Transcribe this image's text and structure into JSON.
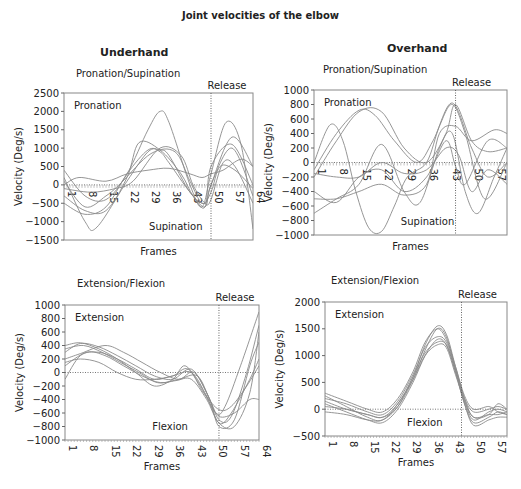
{
  "title": "Joint velocities of the elbow",
  "columns": [
    "Underhand",
    "Overhand"
  ],
  "chart_data": [
    {
      "id": "underhand-pronation",
      "type": "line",
      "title": "Pronation/Supination",
      "column": "Underhand",
      "xlabel": "Frames",
      "ylabel": "Velocity (Deg/s)",
      "ylim": [
        -1500,
        2500
      ],
      "yticks": [
        2500,
        2000,
        1500,
        1000,
        500,
        0,
        -500,
        -1000,
        -1500
      ],
      "xlim": [
        1,
        64
      ],
      "xticks": [
        1,
        8,
        15,
        22,
        29,
        36,
        43,
        50,
        57,
        64
      ],
      "xtick_position": "zero-line",
      "top_label": "Pronation",
      "bottom_label": "Supination",
      "release_frame": 50,
      "release_label": "Release",
      "box": {
        "x": 64,
        "y": 93,
        "w": 189,
        "h": 147
      },
      "series": [
        {
          "x": [
            1,
            8,
            15,
            22,
            29,
            33,
            36,
            43,
            47,
            50,
            55,
            60,
            64
          ],
          "y": [
            400,
            -300,
            -400,
            300,
            1500,
            2000,
            1700,
            0,
            -600,
            300,
            1700,
            1100,
            -1200
          ]
        },
        {
          "x": [
            1,
            8,
            12,
            22,
            29,
            33,
            36,
            43,
            48,
            50,
            57,
            64
          ],
          "y": [
            200,
            -1000,
            -1150,
            100,
            900,
            950,
            800,
            -200,
            -500,
            0,
            1300,
            500
          ]
        },
        {
          "x": [
            1,
            8,
            15,
            22,
            29,
            33,
            36,
            43,
            48,
            50,
            57,
            64
          ],
          "y": [
            -500,
            -800,
            -600,
            300,
            950,
            900,
            600,
            -200,
            -600,
            0,
            1000,
            -300
          ]
        },
        {
          "x": [
            1,
            8,
            15,
            22,
            26,
            33,
            40,
            44,
            48,
            50,
            57,
            64
          ],
          "y": [
            -300,
            -700,
            -700,
            200,
            1150,
            950,
            300,
            -300,
            -600,
            500,
            1100,
            0
          ]
        },
        {
          "x": [
            1,
            6,
            15,
            22,
            29,
            36,
            43,
            47,
            50,
            54,
            60,
            64
          ],
          "y": [
            0,
            200,
            100,
            300,
            400,
            450,
            300,
            200,
            300,
            400,
            700,
            500
          ]
        },
        {
          "x": [
            1,
            10,
            18,
            24,
            33,
            40,
            44,
            48,
            50,
            54,
            58,
            64
          ],
          "y": [
            -100,
            -200,
            -100,
            100,
            1000,
            800,
            0,
            -500,
            -400,
            600,
            500,
            -500
          ]
        },
        {
          "x": [
            1,
            8,
            15,
            20,
            30,
            38,
            43,
            47,
            50,
            53,
            58,
            64
          ],
          "y": [
            100,
            -600,
            -300,
            50,
            850,
            900,
            100,
            -500,
            -200,
            500,
            400,
            -100
          ]
        }
      ]
    },
    {
      "id": "overhand-pronation",
      "type": "line",
      "title": "Pronation/Supination",
      "column": "Overhand",
      "xlabel": "Frames",
      "ylabel": "Velocity (Deg/s)",
      "ylim": [
        -1000,
        1000
      ],
      "yticks": [
        1000,
        800,
        600,
        400,
        200,
        0,
        -200,
        -400,
        -600,
        -800,
        -1000
      ],
      "xlim": [
        1,
        61
      ],
      "xticks": [
        1,
        8,
        15,
        22,
        29,
        36,
        43,
        50,
        57
      ],
      "xtick_position": "zero-line",
      "top_label": "Pronation",
      "bottom_label": "Supination",
      "release_frame": 45,
      "release_label": "Release",
      "box": {
        "x": 314,
        "y": 90,
        "w": 193,
        "h": 145
      },
      "series": [
        {
          "x": [
            1,
            6,
            10,
            14,
            18,
            22,
            26,
            30,
            36,
            40,
            44,
            48,
            54,
            61
          ],
          "y": [
            0,
            520,
            300,
            -400,
            -900,
            -950,
            -600,
            -200,
            0,
            500,
            800,
            400,
            -500,
            0
          ]
        },
        {
          "x": [
            1,
            8,
            15,
            20,
            26,
            33,
            38,
            44,
            50,
            55,
            61
          ],
          "y": [
            -100,
            400,
            720,
            650,
            300,
            0,
            300,
            820,
            200,
            -200,
            0
          ]
        },
        {
          "x": [
            1,
            8,
            15,
            22,
            29,
            36,
            42,
            45,
            50,
            55,
            61
          ],
          "y": [
            -200,
            300,
            700,
            700,
            200,
            0,
            400,
            800,
            300,
            150,
            200
          ]
        },
        {
          "x": [
            1,
            8,
            15,
            22,
            29,
            34,
            40,
            44,
            48,
            52,
            57,
            61
          ],
          "y": [
            -700,
            -500,
            -300,
            250,
            -400,
            -550,
            200,
            400,
            -400,
            -700,
            -200,
            200
          ]
        },
        {
          "x": [
            1,
            8,
            15,
            22,
            29,
            36,
            40,
            45,
            50,
            57,
            61
          ],
          "y": [
            -500,
            -500,
            -400,
            -300,
            -450,
            -300,
            400,
            500,
            300,
            450,
            400
          ]
        },
        {
          "x": [
            1,
            8,
            15,
            22,
            29,
            36,
            42,
            45,
            48,
            55,
            61
          ],
          "y": [
            -400,
            -550,
            -200,
            -100,
            -400,
            -200,
            300,
            -50,
            -300,
            300,
            200
          ]
        },
        {
          "x": [
            1,
            8,
            15,
            22,
            29,
            36,
            42,
            46,
            50,
            55,
            61
          ],
          "y": [
            -150,
            -200,
            -200,
            0,
            -150,
            -100,
            200,
            100,
            -400,
            -100,
            -300
          ]
        }
      ]
    },
    {
      "id": "underhand-extension",
      "type": "line",
      "title": "Extension/Flexion",
      "column": "Underhand",
      "xlabel": "Frames",
      "ylabel": "Velocity (Deg/s)",
      "ylim": [
        -1000,
        1000
      ],
      "yticks": [
        1000,
        800,
        600,
        400,
        200,
        0,
        -200,
        -400,
        -600,
        -800,
        -1000
      ],
      "xlim": [
        1,
        64
      ],
      "xticks": [
        1,
        8,
        15,
        22,
        29,
        36,
        43,
        50,
        57,
        64
      ],
      "xtick_position": "bottom",
      "top_label": "Extension",
      "bottom_label": "Flexion",
      "release_frame": 51,
      "release_label": "Release",
      "box": {
        "x": 65,
        "y": 305,
        "w": 194,
        "h": 135
      },
      "series": [
        {
          "x": [
            1,
            6,
            12,
            18,
            24,
            30,
            36,
            40,
            45,
            50,
            53,
            58,
            64
          ],
          "y": [
            400,
            440,
            350,
            200,
            0,
            -200,
            -100,
            100,
            -200,
            -600,
            -500,
            100,
            900
          ]
        },
        {
          "x": [
            1,
            6,
            12,
            18,
            24,
            30,
            36,
            42,
            47,
            51,
            55,
            60,
            64
          ],
          "y": [
            300,
            430,
            380,
            250,
            100,
            -50,
            -100,
            50,
            -300,
            -700,
            -650,
            0,
            700
          ]
        },
        {
          "x": [
            1,
            6,
            14,
            20,
            26,
            32,
            38,
            43,
            48,
            51,
            56,
            61,
            64
          ],
          "y": [
            200,
            280,
            400,
            300,
            150,
            0,
            -100,
            0,
            -400,
            -800,
            -700,
            100,
            450
          ]
        },
        {
          "x": [
            1,
            6,
            12,
            18,
            24,
            30,
            36,
            42,
            47,
            51,
            55,
            61,
            64
          ],
          "y": [
            -100,
            250,
            300,
            200,
            50,
            -100,
            -50,
            0,
            -350,
            -750,
            -600,
            -100,
            200
          ]
        },
        {
          "x": [
            1,
            8,
            14,
            20,
            26,
            32,
            38,
            44,
            48,
            51,
            56,
            61,
            64
          ],
          "y": [
            100,
            300,
            250,
            100,
            -50,
            -150,
            -100,
            -50,
            -400,
            -650,
            -600,
            -400,
            -400
          ]
        },
        {
          "x": [
            1,
            6,
            12,
            18,
            24,
            30,
            36,
            41,
            46,
            51,
            55,
            60,
            64
          ],
          "y": [
            150,
            200,
            150,
            0,
            -100,
            -100,
            -50,
            50,
            -300,
            -550,
            -500,
            -200,
            100
          ]
        },
        {
          "x": [
            1,
            7,
            13,
            19,
            25,
            31,
            37,
            42,
            47,
            51,
            56,
            61,
            64
          ],
          "y": [
            350,
            400,
            300,
            150,
            0,
            -150,
            -120,
            -100,
            -400,
            -750,
            -800,
            -300,
            600
          ]
        }
      ]
    },
    {
      "id": "overhand-extension",
      "type": "line",
      "title": "Extension/Flexion",
      "column": "Overhand",
      "xlabel": "Frames",
      "ylabel": "Velocity (Deg/s)",
      "ylim": [
        -500,
        2000
      ],
      "yticks": [
        2000,
        1500,
        1000,
        500,
        0,
        -500
      ],
      "xlim": [
        1,
        61
      ],
      "xticks": [
        1,
        8,
        15,
        22,
        29,
        36,
        43,
        50,
        57
      ],
      "xtick_position": "bottom",
      "top_label": "Extension",
      "bottom_label": "Flexion",
      "release_frame": 46,
      "release_label": "Release",
      "box": {
        "x": 325,
        "y": 302,
        "w": 182,
        "h": 134
      },
      "series": [
        {
          "x": [
            1,
            8,
            15,
            20,
            25,
            30,
            34,
            38,
            41,
            44,
            47,
            50,
            55,
            58,
            61
          ],
          "y": [
            250,
            50,
            -150,
            -200,
            100,
            600,
            1200,
            1550,
            1400,
            800,
            200,
            -150,
            -100,
            100,
            0
          ]
        },
        {
          "x": [
            1,
            8,
            15,
            20,
            25,
            30,
            34,
            38,
            41,
            44,
            47,
            50,
            55,
            58,
            61
          ],
          "y": [
            150,
            0,
            -100,
            -150,
            50,
            550,
            1100,
            1500,
            1350,
            750,
            150,
            -200,
            -50,
            0,
            -50
          ]
        },
        {
          "x": [
            1,
            8,
            15,
            20,
            25,
            30,
            34,
            38,
            41,
            44,
            47,
            50,
            55,
            58,
            61
          ],
          "y": [
            100,
            -50,
            -200,
            -250,
            0,
            500,
            1000,
            1300,
            1200,
            700,
            100,
            -250,
            -150,
            -50,
            -100
          ]
        },
        {
          "x": [
            1,
            8,
            15,
            20,
            25,
            30,
            34,
            38,
            41,
            44,
            47,
            50,
            55,
            58,
            61
          ],
          "y": [
            200,
            100,
            -50,
            -100,
            150,
            650,
            1150,
            1350,
            1250,
            750,
            200,
            -50,
            0,
            50,
            0
          ]
        },
        {
          "x": [
            1,
            8,
            15,
            20,
            25,
            30,
            34,
            38,
            41,
            44,
            47,
            50,
            55,
            58,
            61
          ],
          "y": [
            -50,
            -100,
            -200,
            -200,
            50,
            600,
            1050,
            1250,
            1200,
            700,
            100,
            -300,
            -200,
            -150,
            -150
          ]
        },
        {
          "x": [
            1,
            8,
            15,
            20,
            25,
            30,
            34,
            38,
            41,
            44,
            47,
            50,
            55,
            58,
            61
          ],
          "y": [
            50,
            0,
            -100,
            -150,
            100,
            550,
            1000,
            1200,
            1150,
            650,
            150,
            -150,
            -100,
            -100,
            -50
          ]
        },
        {
          "x": [
            1,
            8,
            15,
            20,
            25,
            30,
            34,
            38,
            41,
            44,
            47,
            50,
            55,
            58,
            61
          ],
          "y": [
            300,
            150,
            0,
            -50,
            200,
            700,
            1250,
            1500,
            1300,
            800,
            250,
            0,
            50,
            -50,
            -100
          ]
        }
      ]
    }
  ]
}
